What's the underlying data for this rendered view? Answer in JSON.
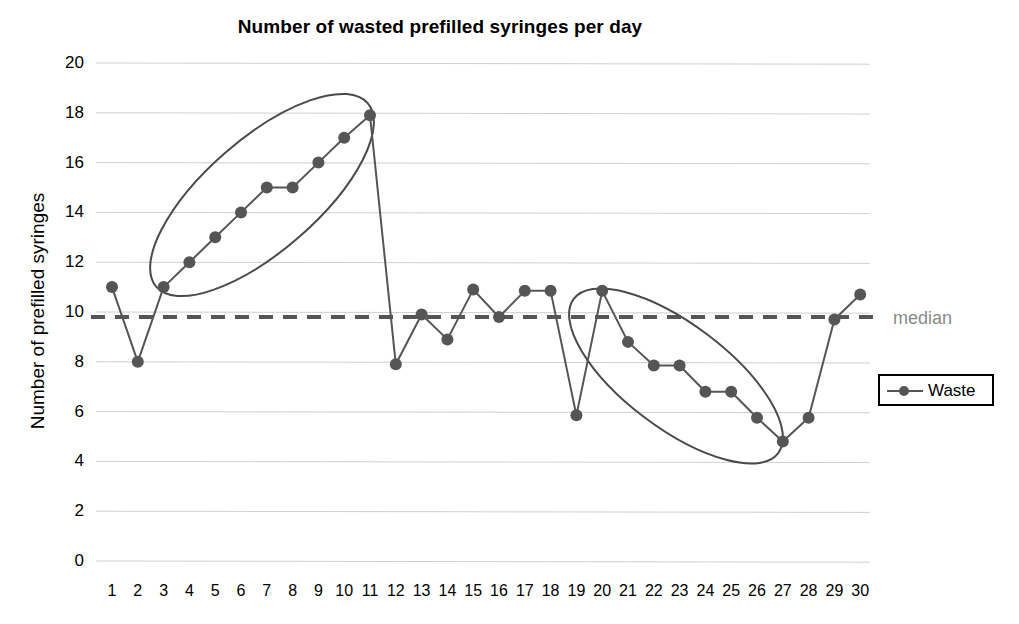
{
  "chart_data": {
    "type": "line",
    "title": "Number of wasted prefilled syringes per day",
    "xlabel": "",
    "ylabel": "Number of prefilled syringes",
    "ylim": [
      0,
      20
    ],
    "ytick_step": 2,
    "yticks": [
      "0",
      "2",
      "4",
      "6",
      "8",
      "10",
      "12",
      "14",
      "16",
      "18",
      "20"
    ],
    "grid": true,
    "legend_position": "right",
    "categories": [
      "1",
      "2",
      "3",
      "4",
      "5",
      "6",
      "7",
      "8",
      "9",
      "10",
      "11",
      "12",
      "13",
      "14",
      "15",
      "16",
      "17",
      "18",
      "19",
      "20",
      "21",
      "22",
      "23",
      "24",
      "25",
      "26",
      "27",
      "28",
      "29",
      "30"
    ],
    "series": [
      {
        "name": "Waste",
        "color": "#555555",
        "values": [
          11.0,
          8.0,
          11.0,
          12.0,
          13.0,
          14.0,
          15.0,
          15.0,
          16.0,
          17.0,
          17.9,
          7.9,
          9.9,
          8.9,
          10.9,
          9.8,
          10.85,
          10.85,
          5.85,
          10.85,
          8.8,
          7.85,
          7.85,
          6.8,
          6.8,
          5.75,
          4.8,
          5.75,
          9.7,
          10.7
        ]
      }
    ],
    "reference_lines": [
      {
        "name": "median",
        "label": "median",
        "value": 9.8,
        "style": "dashed",
        "color": "#555555",
        "label_color": "#8a8a8a"
      }
    ],
    "annotations": [
      {
        "name": "ellipse-rising-trend",
        "shape": "ellipse",
        "covers_days": [
          3,
          11
        ],
        "description": "rising run days 3-11"
      },
      {
        "name": "ellipse-falling-trend",
        "shape": "ellipse",
        "covers_days": [
          20,
          27
        ],
        "description": "falling run days 20-27"
      }
    ]
  },
  "legend": {
    "items": [
      {
        "label": "Waste"
      }
    ]
  }
}
